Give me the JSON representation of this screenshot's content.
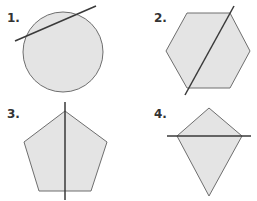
{
  "colors": {
    "fill": "#e4e4e4",
    "stroke": "#6e6e6e",
    "line": "#3a3a3a",
    "label": "#333333"
  },
  "figures": [
    {
      "label": "1.",
      "shape": "circle",
      "cut": "oblique secant line"
    },
    {
      "label": "2.",
      "shape": "hexagon",
      "cut": "diagonal line"
    },
    {
      "label": "3.",
      "shape": "pentagon",
      "cut": "vertical line through top vertex"
    },
    {
      "label": "4.",
      "shape": "kite",
      "cut": "horizontal line through side vertices"
    }
  ]
}
